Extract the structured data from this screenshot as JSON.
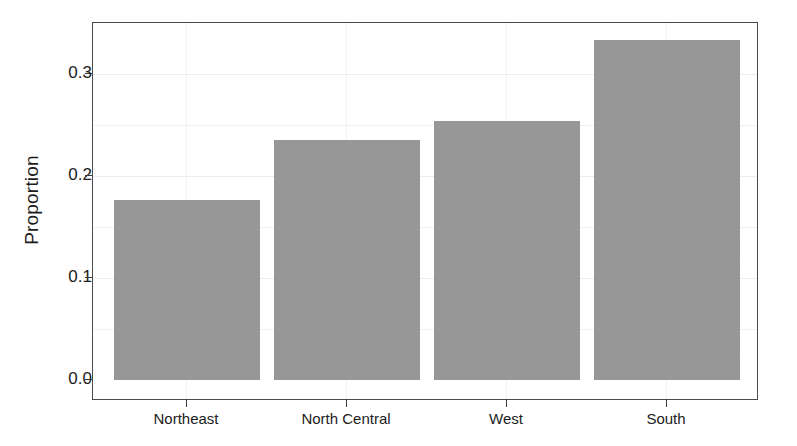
{
  "chart_data": {
    "type": "bar",
    "title": "",
    "subtitle": "",
    "xlabel": "",
    "ylabel": "Proportion",
    "categories": [
      "Northeast",
      "North Central",
      "West",
      "South"
    ],
    "values": [
      0.177,
      0.236,
      0.255,
      0.335
    ],
    "series": [
      {
        "name": "Proportion",
        "values": [
          0.177,
          0.236,
          0.255,
          0.335
        ]
      }
    ],
    "ylim": [
      0.0,
      0.3725
    ],
    "yticks": [
      0.0,
      0.1,
      0.2,
      0.3
    ],
    "ytick_labels": [
      "0.0",
      "0.1",
      "0.2",
      "0.3"
    ],
    "grid": "faint",
    "legend": "none",
    "bar_color": "#9a9a9a",
    "panel_border_color": "#4a4a4a",
    "background_color": "#ffffff",
    "text_color": "#1c1c1c"
  }
}
